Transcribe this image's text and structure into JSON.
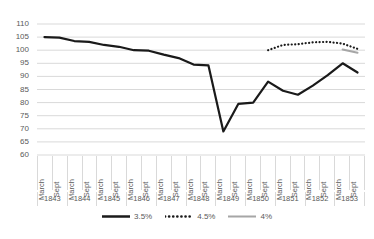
{
  "chart_data": {
    "type": "line",
    "title": "",
    "xlabel": "",
    "ylabel": "",
    "ylim": [
      60,
      110
    ],
    "ytick_step": 5,
    "yticks": [
      110,
      105,
      100,
      95,
      90,
      85,
      80,
      75,
      70,
      65,
      60
    ],
    "grid": true,
    "legend_position": "bottom",
    "years": [
      "1843",
      "1844",
      "1845",
      "1846",
      "1847",
      "1848",
      "1849",
      "1850",
      "1851",
      "1852",
      "1853"
    ],
    "months": [
      "March",
      "Sept"
    ],
    "categories": [
      "March 1843",
      "Sept 1843",
      "March 1844",
      "Sept 1844",
      "March 1845",
      "Sept 1845",
      "March 1846",
      "Sept 1846",
      "March 1847",
      "Sept 1847",
      "March 1848",
      "Sept 1848",
      "March 1849",
      "Sept 1849",
      "March 1850",
      "Sept 1850",
      "March 1851",
      "Sept 1851",
      "March 1852",
      "Sept 1852",
      "March 1853",
      "Sept 1853"
    ],
    "series": [
      {
        "name": "3.5%",
        "color": "#1a1a1a",
        "style": "solid",
        "width": 2.2,
        "x": [
          0,
          1,
          2,
          3,
          4,
          5,
          6,
          7,
          8,
          9,
          10,
          11,
          12,
          13,
          14,
          15,
          16,
          17,
          18,
          19,
          20,
          21
        ],
        "values": [
          105.0,
          104.8,
          103.5,
          103.2,
          102.0,
          101.3,
          100.0,
          99.8,
          98.3,
          97.0,
          94.5,
          94.2,
          69.0,
          79.5,
          80.0,
          88.0,
          84.5,
          83.0,
          86.5,
          90.5,
          95.0,
          91.5
        ]
      },
      {
        "name": "4.5%",
        "color": "#1a1a1a",
        "style": "dotted",
        "width": 2.2,
        "x": [
          15,
          16,
          17,
          18,
          19,
          20,
          21
        ],
        "values": [
          100.0,
          102.0,
          102.3,
          103.0,
          103.2,
          102.5,
          100.5
        ]
      },
      {
        "name": "4%",
        "color": "#a6a6a6",
        "style": "solid",
        "width": 2.0,
        "x": [
          20,
          21
        ],
        "values": [
          100.3,
          99.0
        ]
      }
    ]
  },
  "legend": {
    "items": [
      {
        "label": "3.5%",
        "color": "#1a1a1a",
        "style": "solid"
      },
      {
        "label": "4.5%",
        "color": "#1a1a1a",
        "style": "dotted"
      },
      {
        "label": "4%",
        "color": "#a6a6a6",
        "style": "solid"
      }
    ]
  }
}
